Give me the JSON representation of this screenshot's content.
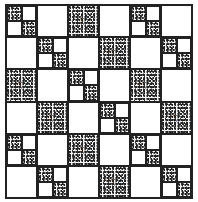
{
  "pattern": {
    "title": "Speckled square quilt pattern",
    "grid": {
      "rows": 6,
      "cols": 6
    },
    "colors": {
      "line": "#222222",
      "plain": "#ffffff",
      "speckle": "#222222"
    },
    "legend": {
      "P": "plain square",
      "S": "speckled square",
      "D": "four-patch with speckled top-left and bottom-right"
    },
    "rows": [
      [
        "D",
        "P",
        "S",
        "P",
        "D",
        "P"
      ],
      [
        "P",
        "D",
        "P",
        "S",
        "P",
        "D"
      ],
      [
        "S",
        "P",
        "D",
        "P",
        "S",
        "P"
      ],
      [
        "P",
        "S",
        "P",
        "D",
        "P",
        "S"
      ],
      [
        "D",
        "P",
        "S",
        "P",
        "D",
        "P"
      ],
      [
        "P",
        "D",
        "P",
        "S",
        "P",
        "D"
      ]
    ],
    "triangle_glyph": "▽"
  }
}
